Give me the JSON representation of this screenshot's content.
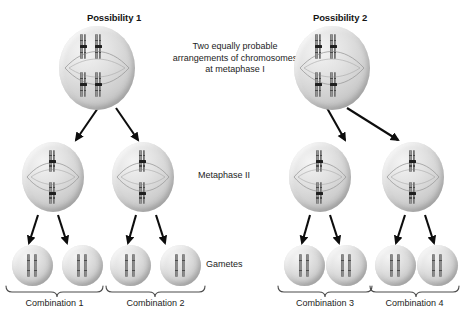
{
  "figure": {
    "possibility_1_title": "Possibility 1",
    "possibility_2_title": "Possibility 2",
    "caption": "Two equally probable arrangements of chromosomes at metaphase I",
    "metaphase_ii_label": "Metaphase II",
    "gametes_label": "Gametes",
    "combination_1_label": "Combination 1",
    "combination_2_label": "Combination 2",
    "combination_3_label": "Combination 3",
    "combination_4_label": "Combination 4",
    "colors": {
      "background": "#ffffff",
      "text": "#1c1c1c",
      "title_text": "#161616",
      "cell_fill_light": "#f4f4f4",
      "cell_fill_dark": "#ababab",
      "chromosome_dark": "#6b6b6b",
      "centromere": "#1f1f1f",
      "arrow": "#0d0d0d",
      "brace": "#4a4a4a"
    }
  },
  "cells": {
    "possibility_1_parent": {
      "name": "metaphase-I-cell-possibility-1",
      "stage": "Metaphase I",
      "chromosome_count": 4,
      "description": "Four duplicated chromosomes aligned as two homologous pairs on the metaphase plate"
    },
    "possibility_2_parent": {
      "name": "metaphase-I-cell-possibility-2",
      "stage": "Metaphase I",
      "chromosome_count": 4,
      "description": "Four duplicated chromosomes aligned as two homologous pairs in the alternate arrangement"
    },
    "metaphase_ii": {
      "stage": "Metaphase II",
      "chromosome_count": 2,
      "count_total": 4
    },
    "gametes": {
      "stage": "Gametes",
      "chromosome_count": 2,
      "count_total": 8
    }
  },
  "structure": {
    "levels": [
      "Metaphase I",
      "Metaphase II",
      "Gametes"
    ],
    "combinations": [
      "Combination 1",
      "Combination 2",
      "Combination 3",
      "Combination 4"
    ],
    "gametes_per_combination": 2
  }
}
